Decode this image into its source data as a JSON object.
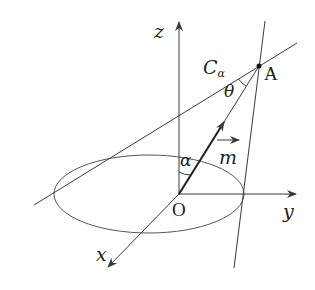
{
  "diagram": {
    "type": "3d-geometry",
    "labels": {
      "z_axis": "z",
      "y_axis": "y",
      "x_axis": "x",
      "origin": "O",
      "point": "A",
      "cone_main": "C",
      "cone_sub": "α",
      "angle_theta": "θ",
      "angle_alpha": "α",
      "vector": "m",
      "vector_arrow": "→"
    },
    "colors": {
      "line": "#3a3a3a",
      "text": "#222222",
      "background": "#ffffff"
    }
  }
}
